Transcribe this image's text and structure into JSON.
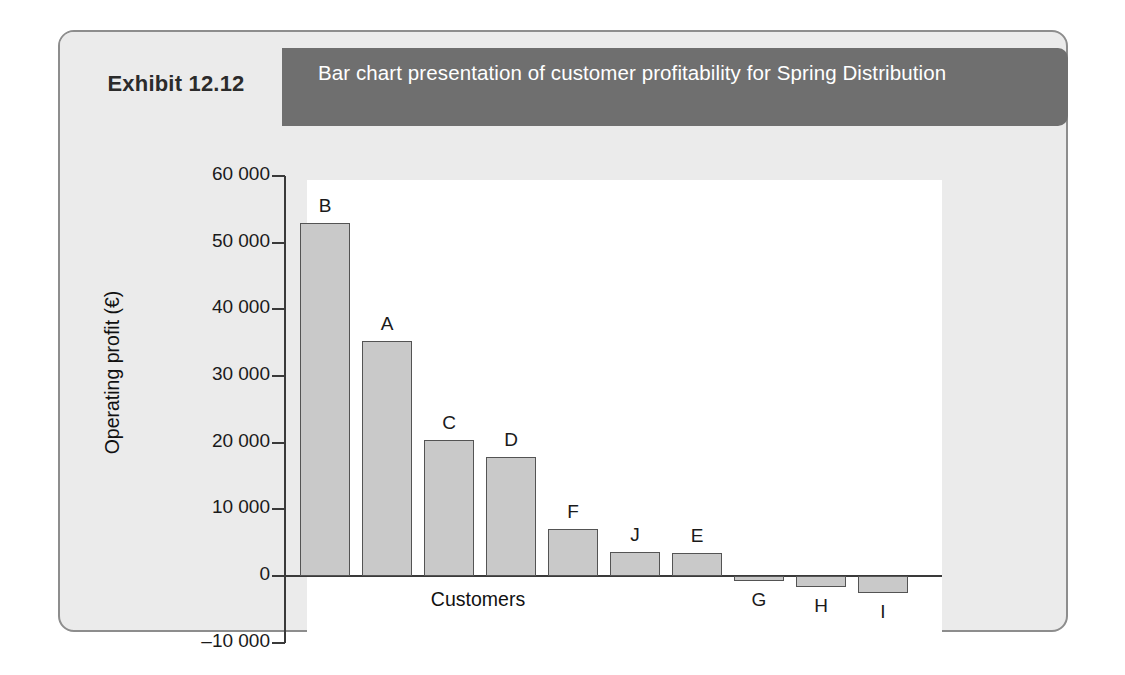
{
  "exhibit": {
    "number": "Exhibit 12.12",
    "title": "Bar chart presentation of customer profitability for Spring Distribution"
  },
  "colors": {
    "header_band": "#6f6f6f",
    "card_background": "#ebebeb",
    "card_border": "#8d8d8d",
    "plot_background": "#ffffff",
    "bar_fill": "#c9c9c9",
    "bar_stroke": "#545454",
    "axis": "#3a3a3a",
    "text": "#1a1a1a",
    "header_text": "#ffffff"
  },
  "chart_data": {
    "type": "bar",
    "title": "Bar chart presentation of customer profitability for Spring Distribution",
    "xlabel": "Customers",
    "ylabel": "Operating profit (€)",
    "categories": [
      "B",
      "A",
      "C",
      "D",
      "F",
      "J",
      "E",
      "G",
      "H",
      "I"
    ],
    "values": [
      53000,
      35200,
      20400,
      17800,
      7000,
      3600,
      3500,
      -800,
      -1600,
      -2500
    ],
    "ylim": [
      -10000,
      60000
    ],
    "ytick_labels": [
      "60 000",
      "50 000",
      "40 000",
      "30 000",
      "20 000",
      "10 000",
      "0",
      "–10 000"
    ],
    "ytick_values": [
      60000,
      50000,
      40000,
      30000,
      20000,
      10000,
      0,
      -10000
    ],
    "grid": false,
    "legend": false,
    "bar_labels_above": true
  }
}
